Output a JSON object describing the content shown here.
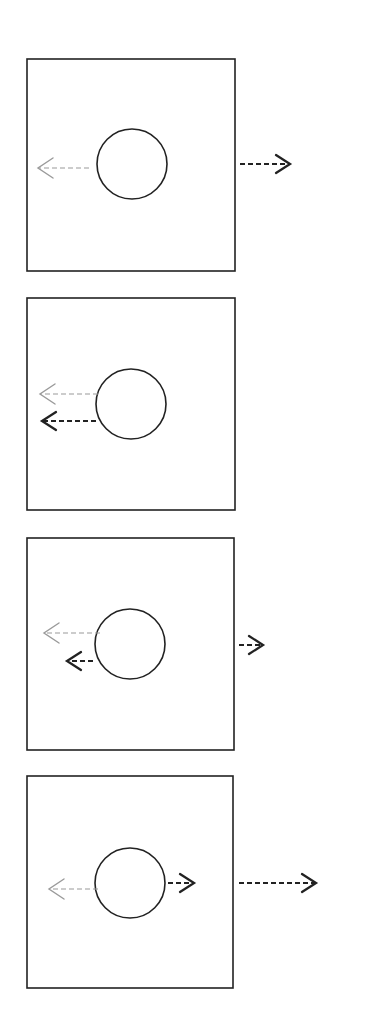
{
  "colors": {
    "background": "#ffffff",
    "stroke": "#222222",
    "ghost": "#9a9a9a"
  },
  "panels": [
    {
      "id": "panel-1",
      "box": {
        "x": 27,
        "y": 59,
        "w": 208,
        "h": 212
      },
      "circle": {
        "cx": 132,
        "cy": 164,
        "r": 35
      },
      "arrows": [
        {
          "name": "ghost-arrow-left",
          "x1": 89,
          "y1": 168,
          "x2": 38,
          "y2": 168,
          "style": "ghost"
        },
        {
          "name": "outer-arrow-right",
          "x1": 240,
          "y1": 164,
          "x2": 290,
          "y2": 164,
          "style": "dark"
        }
      ]
    },
    {
      "id": "panel-2",
      "box": {
        "x": 27,
        "y": 298,
        "w": 208,
        "h": 212
      },
      "circle": {
        "cx": 131,
        "cy": 404,
        "r": 35
      },
      "arrows": [
        {
          "name": "ghost-arrow-left",
          "x1": 98,
          "y1": 394,
          "x2": 40,
          "y2": 394,
          "style": "ghost"
        },
        {
          "name": "dark-arrow-left",
          "x1": 96,
          "y1": 421,
          "x2": 42,
          "y2": 421,
          "style": "dark"
        }
      ]
    },
    {
      "id": "panel-3",
      "box": {
        "x": 27,
        "y": 538,
        "w": 207,
        "h": 212
      },
      "circle": {
        "cx": 130,
        "cy": 644,
        "r": 35
      },
      "arrows": [
        {
          "name": "ghost-arrow-left",
          "x1": 100,
          "y1": 633,
          "x2": 44,
          "y2": 633,
          "style": "ghost"
        },
        {
          "name": "dark-arrow-left",
          "x1": 93,
          "y1": 661,
          "x2": 67,
          "y2": 661,
          "style": "dark"
        },
        {
          "name": "outer-arrow-right",
          "x1": 239,
          "y1": 645,
          "x2": 263,
          "y2": 645,
          "style": "dark"
        }
      ]
    },
    {
      "id": "panel-4",
      "box": {
        "x": 27,
        "y": 776,
        "w": 206,
        "h": 212
      },
      "circle": {
        "cx": 130,
        "cy": 883,
        "r": 35
      },
      "arrows": [
        {
          "name": "ghost-arrow-left",
          "x1": 98,
          "y1": 889,
          "x2": 49,
          "y2": 889,
          "style": "ghost"
        },
        {
          "name": "dark-arrow-right",
          "x1": 168,
          "y1": 883,
          "x2": 194,
          "y2": 883,
          "style": "dark"
        },
        {
          "name": "outer-arrow-right",
          "x1": 239,
          "y1": 883,
          "x2": 316,
          "y2": 883,
          "style": "dark"
        }
      ]
    }
  ]
}
